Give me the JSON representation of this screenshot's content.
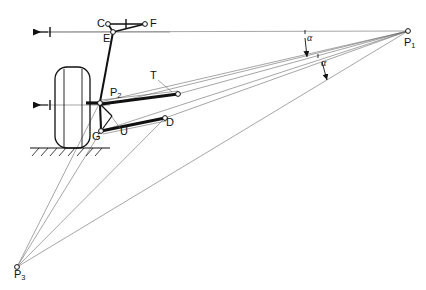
{
  "diagram": {
    "type": "engineering-line-drawing",
    "stroke_color": "#111111",
    "thin_stroke_color": "#555555",
    "background": "#ffffff",
    "labels": {
      "point_c": "C",
      "point_f": "F",
      "point_e": "E",
      "point_t": "T",
      "point_d": "D",
      "point_u": "U",
      "point_g": "G",
      "point_p1": "P",
      "point_p1_sub": "1",
      "point_p2": "P",
      "point_p2_sub": "2",
      "point_p3": "P",
      "point_p3_sub": "3",
      "angle_alpha_upper": "α",
      "angle_alpha_lower": "α"
    },
    "geometry": {
      "points": {
        "C": [
          108,
          24
        ],
        "F": [
          145,
          24
        ],
        "E": [
          113,
          32
        ],
        "P2": [
          100,
          102
        ],
        "G": [
          101,
          131
        ],
        "U": [
          110,
          117
        ],
        "T_joint": [
          178,
          94
        ],
        "D": [
          165,
          118
        ],
        "P1": [
          408,
          31
        ],
        "P3": [
          17,
          267
        ]
      },
      "axis_upper_y": 32,
      "axis_lower_y": 105,
      "ground_y": 148,
      "wheel_rect": [
        55,
        67,
        35,
        81
      ]
    }
  }
}
